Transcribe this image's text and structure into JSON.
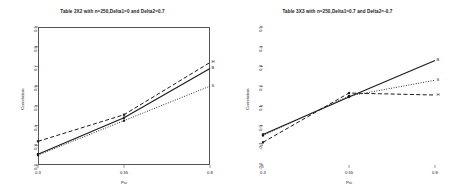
{
  "figure": {
    "background": "#ffffff",
    "panel_count": 2
  },
  "chart_data": [
    {
      "type": "line",
      "panel": "left",
      "title": "Table 2X2 with n=250,Delta1=0 and Delta2=0.7",
      "xlabel": "Psi",
      "ylabel": "Correlation",
      "xlim": [
        0.3,
        0.8
      ],
      "ylim": [
        0.2,
        0.9
      ],
      "xticks": [
        0.3,
        0.55,
        0.8
      ],
      "xticklabels": [
        "0.3",
        "0.55",
        "0.8"
      ],
      "yticks": [
        0.2,
        0.3,
        0.4,
        0.5,
        0.6,
        0.7,
        0.8,
        0.9
      ],
      "yticklabels": [
        "0.2",
        "0.3",
        "0.4",
        "0.5",
        "0.6",
        "0.7",
        "0.8",
        "0.9"
      ],
      "grid": false,
      "legend_position": "line-end-labels",
      "x": [
        0.3,
        0.55,
        0.8
      ],
      "series": [
        {
          "name": "H",
          "linestyle": "dashed",
          "color": "#1a1a1a",
          "end_label": "H",
          "values": [
            0.32,
            0.455,
            0.72
          ]
        },
        {
          "name": "B",
          "linestyle": "solid",
          "color": "#1a1a1a",
          "end_label": "B",
          "values": [
            0.255,
            0.44,
            0.69
          ]
        },
        {
          "name": "S",
          "linestyle": "dotted",
          "color": "#1a1a1a",
          "end_label": "S",
          "values": [
            0.25,
            0.425,
            0.6
          ]
        }
      ],
      "markers": [
        {
          "x": 0.3,
          "y": 0.32
        },
        {
          "x": 0.3,
          "y": 0.255
        },
        {
          "x": 0.3,
          "y": 0.25
        },
        {
          "x": 0.55,
          "y": 0.455
        },
        {
          "x": 0.55,
          "y": 0.44
        },
        {
          "x": 0.55,
          "y": 0.425
        }
      ]
    },
    {
      "type": "line",
      "panel": "right",
      "title": "Table 3X3 with n=250,Delta1=0.7 and Delta2=-0.7",
      "xlabel": "Psi",
      "ylabel": "Correlation",
      "xlim": [
        0.3,
        0.8
      ],
      "ylim": [
        -0.2,
        0.5
      ],
      "xticks": [
        0.3,
        0.55,
        0.8
      ],
      "xticklabels": [
        "0.3",
        "0.55",
        "0.8"
      ],
      "yticks": [
        -0.2,
        -0.1,
        0.0,
        0.1,
        0.2,
        0.3,
        0.4,
        0.5
      ],
      "yticklabels": [
        "-0.2",
        "-0.1",
        "0.0",
        "0.1",
        "0.2",
        "0.3",
        "0.4",
        "0.5"
      ],
      "grid": false,
      "legend_position": "line-end-labels",
      "x": [
        0.3,
        0.55,
        0.8
      ],
      "series": [
        {
          "name": "B",
          "linestyle": "solid",
          "color": "#1a1a1a",
          "end_label": "B",
          "values": [
            -0.045,
            0.145,
            0.33
          ]
        },
        {
          "name": "S",
          "linestyle": "dotted",
          "color": "#1a1a1a",
          "end_label": "S",
          "values": [
            -0.05,
            0.15,
            0.23
          ]
        },
        {
          "name": "H",
          "linestyle": "dashed",
          "color": "#1a1a1a",
          "end_label": "H",
          "values": [
            -0.085,
            0.165,
            0.155
          ]
        }
      ],
      "markers": [
        {
          "x": 0.3,
          "y": -0.045
        },
        {
          "x": 0.3,
          "y": -0.05
        },
        {
          "x": 0.3,
          "y": -0.085
        },
        {
          "x": 0.55,
          "y": 0.145
        },
        {
          "x": 0.55,
          "y": 0.15
        },
        {
          "x": 0.55,
          "y": 0.165
        }
      ]
    }
  ]
}
